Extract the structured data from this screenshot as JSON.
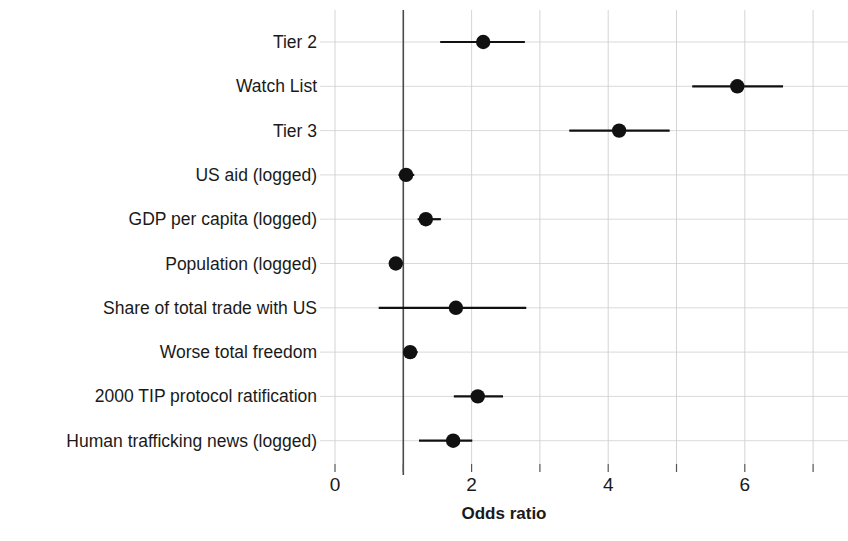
{
  "chart_data": {
    "type": "scatter",
    "title": "",
    "subtitle": "",
    "xlabel": "Odds ratio",
    "ylabel": "",
    "xlim": [
      -0.25,
      7.5
    ],
    "xticks": [
      0,
      2,
      4,
      6
    ],
    "xtick_labels": [
      "0",
      "2",
      "4",
      "6"
    ],
    "grid": true,
    "grid_x_minor": [
      1,
      3,
      5,
      7
    ],
    "legend": "none",
    "reference_line": 1,
    "categories": [
      "Tier 2",
      "Watch List",
      "Tier 3",
      "US aid (logged)",
      "GDP per capita (logged)",
      "Population (logged)",
      "Share of total trade with US",
      "Worse total freedom",
      "2000 TIP protocol ratification",
      "Human trafficking news (logged)"
    ],
    "points": [
      {
        "label": "Tier 2",
        "estimate": 2.17,
        "ci_low": 1.54,
        "ci_high": 2.78
      },
      {
        "label": "Watch List",
        "estimate": 5.89,
        "ci_low": 5.23,
        "ci_high": 6.56
      },
      {
        "label": "Tier 3",
        "estimate": 4.16,
        "ci_low": 3.43,
        "ci_high": 4.9
      },
      {
        "label": "US aid (logged)",
        "estimate": 1.04,
        "ci_low": 0.93,
        "ci_high": 1.16
      },
      {
        "label": "GDP per capita (logged)",
        "estimate": 1.33,
        "ci_low": 1.21,
        "ci_high": 1.55
      },
      {
        "label": "Population (logged)",
        "estimate": 0.89,
        "ci_low": 0.8,
        "ci_high": 0.99
      },
      {
        "label": "Share of total trade with US",
        "estimate": 1.77,
        "ci_low": 0.64,
        "ci_high": 2.8
      },
      {
        "label": "Worse total freedom",
        "estimate": 1.1,
        "ci_low": 1.0,
        "ci_high": 1.21
      },
      {
        "label": "2000 TIP protocol ratification",
        "estimate": 2.09,
        "ci_low": 1.74,
        "ci_high": 2.46
      },
      {
        "label": "Human trafficking news (logged)",
        "estimate": 1.73,
        "ci_low": 1.23,
        "ci_high": 2.01
      }
    ],
    "colors": {
      "point": "#111111",
      "interval": "#111111",
      "grid": "#c9c9c9",
      "reference": "#4a4a4a",
      "background": "#ffffff",
      "text": "#1a1a1a"
    }
  }
}
